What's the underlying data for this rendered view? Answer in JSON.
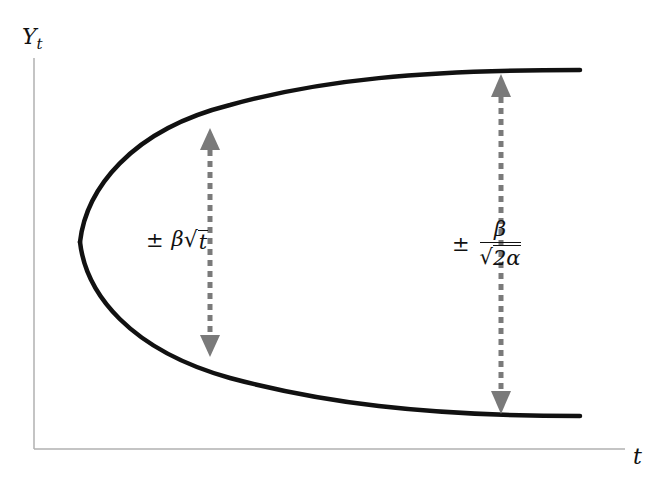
{
  "diagram": {
    "y_axis_label": {
      "main": "Y",
      "subscript": "t"
    },
    "x_axis_label": "t",
    "left_annotation": {
      "pm": "±",
      "coef": "β",
      "radical": "√",
      "radicand": "t"
    },
    "right_annotation": {
      "pm": "±",
      "numerator": "β",
      "radical": "√",
      "denominator_radicand": "2α"
    },
    "colors": {
      "curve": "#111111",
      "axis": "#b0b0b0",
      "arrow": "#7a7a7a",
      "text": "#111111"
    }
  }
}
